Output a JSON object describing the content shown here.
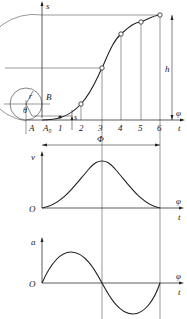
{
  "diagram": {
    "type": "cam follower motion diagram (sinusoidal/cycloidal rise)",
    "displacement_plot": {
      "y_label": "s",
      "x_labels": [
        "φ",
        "t"
      ],
      "rise_label": "h",
      "point_labels": [
        "A₀",
        "1",
        "2",
        "3",
        "4",
        "5",
        "6"
      ],
      "origin_label": "A",
      "circle_labels": {
        "radius": "r",
        "angle": "θ",
        "point": "B"
      },
      "small_displacement_label": "s",
      "period_label": "Φ"
    },
    "velocity_plot": {
      "y_label": "v",
      "origin_label": "O",
      "x_labels": [
        "φ",
        "t"
      ]
    },
    "acceleration_plot": {
      "y_label": "a",
      "origin_label": "O",
      "x_labels": [
        "φ",
        "t"
      ]
    },
    "colors": {
      "line": "#222222",
      "thin": "#555555",
      "background": "#ffffff"
    }
  }
}
